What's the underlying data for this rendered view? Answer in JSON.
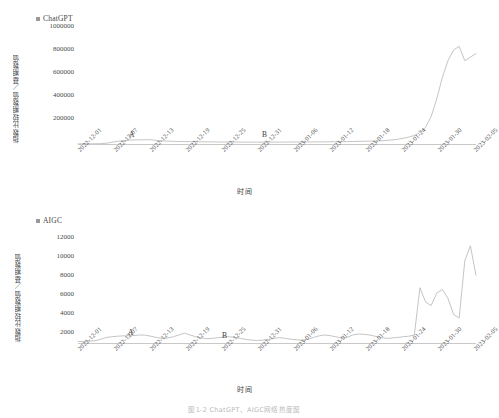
{
  "figure": {
    "caption": "图1-2  ChatGPT、AIGC网络热度图"
  },
  "panels": [
    {
      "id": "chatgpt",
      "legend_label": "ChatGPT",
      "legend_color": "#9a9a9a",
      "ylabel": "指数比较期数值／基期数值",
      "xtitle": "时间",
      "annotations": [
        {
          "label": "A"
        },
        {
          "label": "B"
        }
      ],
      "chart_data": {
        "type": "line",
        "title": "ChatGPT",
        "xlabel": "时间",
        "ylabel": "指数比较期数值／基期数值",
        "legend": [
          "ChatGPT"
        ],
        "legend_position": "top-left",
        "grid": false,
        "ylim": [
          0,
          1000000
        ],
        "yticks": [
          200000,
          400000,
          600000,
          800000,
          1000000
        ],
        "xticks": [
          "2022-12-01",
          "2022-12-07",
          "2022-12-13",
          "2022-12-19",
          "2022-12-25",
          "2022-12-31",
          "2023-01-06",
          "2023-01-12",
          "2023-01-18",
          "2023-01-24",
          "2023-01-30",
          "2023-02-05"
        ],
        "annotations": [
          {
            "label": "A",
            "x": "2022-12-14"
          },
          {
            "label": "B",
            "x": "2023-01-08"
          }
        ],
        "x": [
          "2022-12-01",
          "2022-12-02",
          "2022-12-03",
          "2022-12-04",
          "2022-12-05",
          "2022-12-06",
          "2022-12-07",
          "2022-12-08",
          "2022-12-09",
          "2022-12-10",
          "2022-12-11",
          "2022-12-12",
          "2022-12-13",
          "2022-12-14",
          "2022-12-15",
          "2022-12-16",
          "2022-12-17",
          "2022-12-18",
          "2022-12-19",
          "2022-12-20",
          "2022-12-21",
          "2022-12-22",
          "2022-12-23",
          "2022-12-24",
          "2022-12-25",
          "2022-12-26",
          "2022-12-27",
          "2022-12-28",
          "2022-12-29",
          "2022-12-30",
          "2022-12-31",
          "2023-01-01",
          "2023-01-02",
          "2023-01-03",
          "2023-01-04",
          "2023-01-05",
          "2023-01-06",
          "2023-01-07",
          "2023-01-08",
          "2023-01-09",
          "2023-01-10",
          "2023-01-11",
          "2023-01-12",
          "2023-01-13",
          "2023-01-14",
          "2023-01-15",
          "2023-01-16",
          "2023-01-17",
          "2023-01-18",
          "2023-01-19",
          "2023-01-20",
          "2023-01-21",
          "2023-01-22",
          "2023-01-23",
          "2023-01-24",
          "2023-01-25",
          "2023-01-26",
          "2023-01-27",
          "2023-01-28",
          "2023-01-29",
          "2023-01-30",
          "2023-01-31",
          "2023-02-01",
          "2023-02-02",
          "2023-02-03",
          "2023-02-04",
          "2023-02-05",
          "2023-02-06",
          "2023-02-07",
          "2023-02-08",
          "2023-02-09",
          "2023-02-10"
        ],
        "values": [
          1000,
          1200,
          1500,
          1800,
          2500,
          6000,
          14000,
          22000,
          28000,
          32000,
          34000,
          35000,
          35500,
          36000,
          30000,
          26000,
          24000,
          22000,
          21000,
          20000,
          19500,
          19000,
          18500,
          18000,
          17500,
          17000,
          16800,
          16500,
          16200,
          16000,
          15800,
          15600,
          15500,
          15400,
          15600,
          15800,
          16000,
          16200,
          16500,
          16800,
          17000,
          17200,
          17500,
          17800,
          18000,
          18500,
          19000,
          19500,
          20000,
          21000,
          22000,
          23000,
          24000,
          25000,
          27000,
          30000,
          34000,
          40000,
          48000,
          58000,
          72000,
          95000,
          140000,
          230000,
          380000,
          560000,
          700000,
          790000,
          820000,
          700000,
          730000,
          760000
        ]
      }
    },
    {
      "id": "aigc",
      "legend_label": "AIGC",
      "legend_color": "#9a9a9a",
      "ylabel": "指数比较期数值／基期数值",
      "xtitle": "时间",
      "annotations": [
        {
          "label": "A"
        },
        {
          "label": "B"
        }
      ],
      "chart_data": {
        "type": "line",
        "title": "AIGC",
        "xlabel": "时间",
        "ylabel": "指数比较期数值／基期数值",
        "legend": [
          "AIGC"
        ],
        "legend_position": "top-left",
        "grid": false,
        "ylim": [
          0,
          12000
        ],
        "yticks": [
          2000,
          4000,
          6000,
          8000,
          10000,
          12000
        ],
        "xticks": [
          "2022-12-01",
          "2022-12-07",
          "2022-12-13",
          "2022-12-19",
          "2022-12-25",
          "2022-12-31",
          "2023-01-06",
          "2023-01-12",
          "2023-01-18",
          "2023-01-24",
          "2023-01-30",
          "2023-02-05"
        ],
        "annotations": [
          {
            "label": "A",
            "x": "2022-12-12"
          },
          {
            "label": "B",
            "x": "2023-01-07"
          }
        ],
        "x": [
          "2022-12-01",
          "2022-12-02",
          "2022-12-03",
          "2022-12-04",
          "2022-12-05",
          "2022-12-06",
          "2022-12-07",
          "2022-12-08",
          "2022-12-09",
          "2022-12-10",
          "2022-12-11",
          "2022-12-12",
          "2022-12-13",
          "2022-12-14",
          "2022-12-15",
          "2022-12-16",
          "2022-12-17",
          "2022-12-18",
          "2022-12-19",
          "2022-12-20",
          "2022-12-21",
          "2022-12-22",
          "2022-12-23",
          "2022-12-24",
          "2022-12-25",
          "2022-12-26",
          "2022-12-27",
          "2022-12-28",
          "2022-12-29",
          "2022-12-30",
          "2022-12-31",
          "2023-01-01",
          "2023-01-02",
          "2023-01-03",
          "2023-01-04",
          "2023-01-05",
          "2023-01-06",
          "2023-01-07",
          "2023-01-08",
          "2023-01-09",
          "2023-01-10",
          "2023-01-11",
          "2023-01-12",
          "2023-01-13",
          "2023-01-14",
          "2023-01-15",
          "2023-01-16",
          "2023-01-17",
          "2023-01-18",
          "2023-01-19",
          "2023-01-20",
          "2023-01-21",
          "2023-01-22",
          "2023-01-23",
          "2023-01-24",
          "2023-01-25",
          "2023-01-26",
          "2023-01-27",
          "2023-01-28",
          "2023-01-29",
          "2023-01-30",
          "2023-01-31",
          "2023-02-01",
          "2023-02-02",
          "2023-02-03",
          "2023-02-04",
          "2023-02-05",
          "2023-02-06",
          "2023-02-07",
          "2023-02-08",
          "2023-02-09",
          "2023-02-10"
        ],
        "values": [
          180,
          150,
          200,
          260,
          400,
          620,
          700,
          760,
          800,
          820,
          840,
          900,
          880,
          760,
          620,
          520,
          560,
          700,
          900,
          1100,
          900,
          700,
          560,
          480,
          520,
          600,
          680,
          700,
          620,
          520,
          400,
          320,
          280,
          320,
          420,
          520,
          600,
          520,
          420,
          360,
          320,
          400,
          620,
          800,
          900,
          820,
          700,
          560,
          620,
          900,
          1000,
          980,
          900,
          760,
          620,
          520,
          560,
          620,
          700,
          760,
          900,
          6200,
          4600,
          4200,
          5600,
          6000,
          5000,
          3200,
          2800,
          9200,
          10900,
          7600
        ]
      }
    }
  ]
}
